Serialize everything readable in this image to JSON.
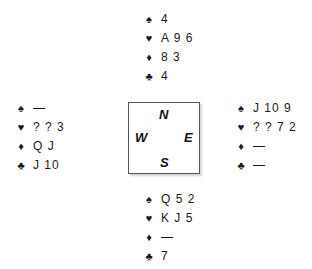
{
  "suits": {
    "spades": "♠",
    "hearts": "♥",
    "diamonds": "♦",
    "clubs": "♣"
  },
  "hands": {
    "north": {
      "spades": "4",
      "hearts": "A 9 6",
      "diamonds": "8 3",
      "clubs": "4"
    },
    "west": {
      "spades": "—",
      "hearts": "? ? 3",
      "diamonds": "Q J",
      "clubs": "J 10"
    },
    "east": {
      "spades": "J 10 9",
      "hearts": "? ? 7 2",
      "diamonds": "—",
      "clubs": "—"
    },
    "south": {
      "spades": "Q 5 2",
      "hearts": "K J 5",
      "diamonds": "—",
      "clubs": "7"
    }
  },
  "compass": {
    "north": "N",
    "west": "W",
    "east": "E",
    "south": "S"
  }
}
